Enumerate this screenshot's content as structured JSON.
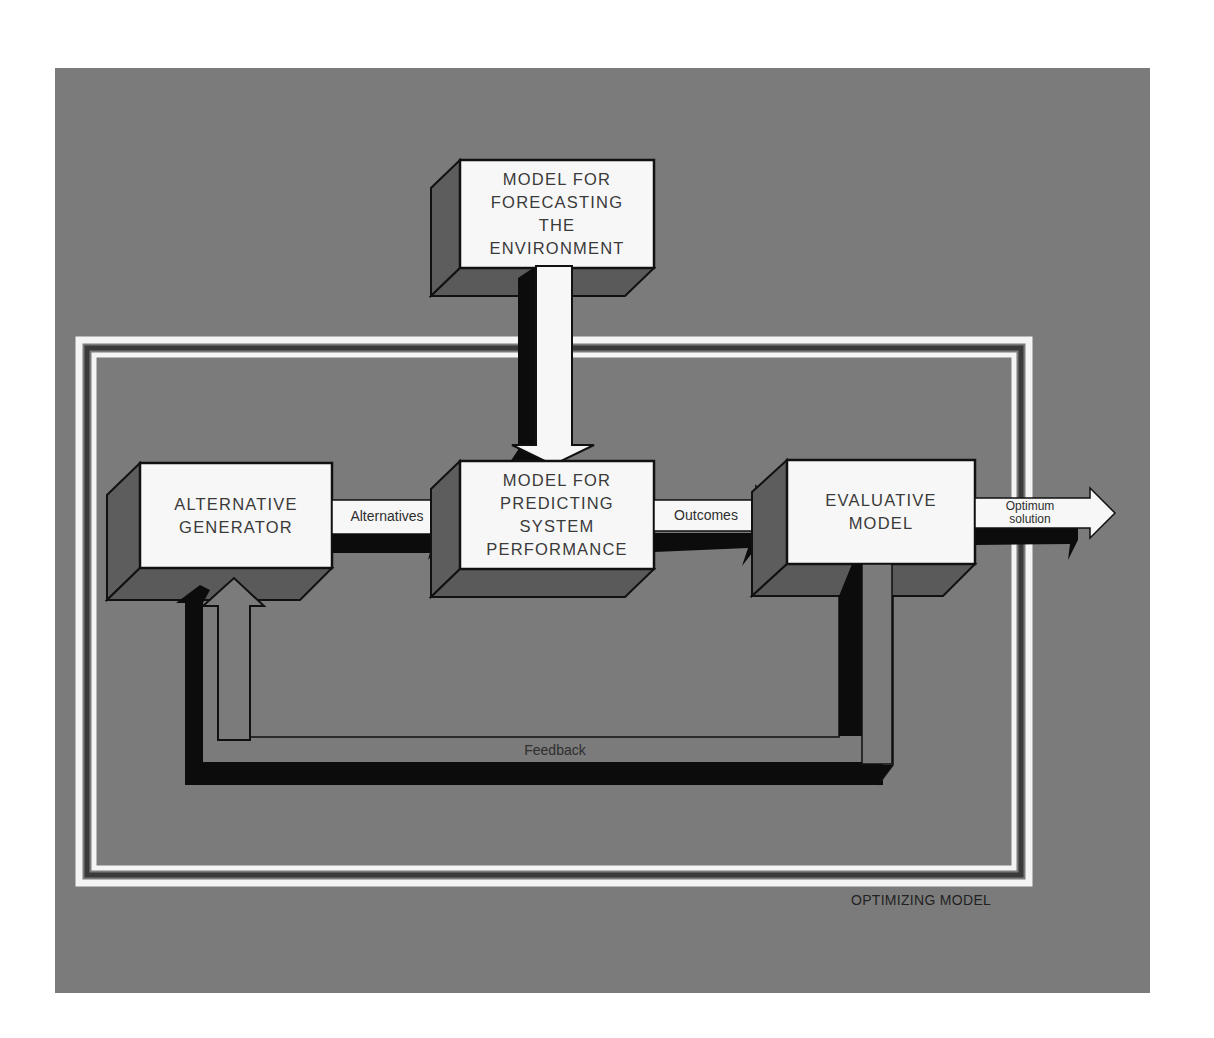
{
  "diagram": {
    "type": "flow-diagram",
    "background_color": "#7b7b7b",
    "box_face_color": "#f7f7f7",
    "shadow_color": "#0c0c0c",
    "boxes": [
      {
        "id": "forecast",
        "lines": [
          "MODEL FOR",
          "FORECASTING",
          "THE",
          "ENVIRONMENT"
        ]
      },
      {
        "id": "alternative_generator",
        "lines": [
          "ALTERNATIVE",
          "GENERATOR"
        ]
      },
      {
        "id": "predicting",
        "lines": [
          "MODEL FOR",
          "PREDICTING",
          "SYSTEM",
          "PERFORMANCE"
        ]
      },
      {
        "id": "evaluative",
        "lines": [
          "EVALUATIVE",
          "MODEL"
        ]
      }
    ],
    "arrows": [
      {
        "from": "forecast",
        "to": "predicting",
        "label": ""
      },
      {
        "from": "alternative_generator",
        "to": "predicting",
        "label": "Alternatives"
      },
      {
        "from": "predicting",
        "to": "evaluative",
        "label": "Outcomes"
      },
      {
        "from": "evaluative",
        "to": "output",
        "label_lines": [
          "Optimum",
          "solution"
        ]
      },
      {
        "from": "evaluative",
        "to": "alternative_generator",
        "label": "Feedback"
      }
    ],
    "frame_caption": "OPTIMIZING MODEL"
  }
}
